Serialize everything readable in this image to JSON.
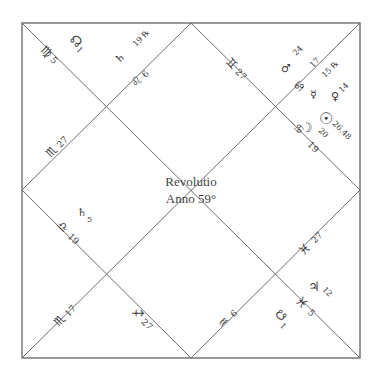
{
  "chart": {
    "title_line1": "Revolutio",
    "title_line2": "Anno 59°",
    "colors": {
      "line": "#6e6e6e",
      "text": "#3a3a3a",
      "background": "#ffffff"
    }
  },
  "labels": [
    {
      "id": "nw-upper-node",
      "glyph": "☊",
      "value": "1",
      "icon": "north-node-icon"
    },
    {
      "id": "nw-virgo-cusp",
      "glyph": "♍",
      "value": "5",
      "icon": "virgo-icon"
    },
    {
      "id": "n-saturn",
      "glyph": "♄",
      "value": "19 ℞",
      "icon": "saturn-icon"
    },
    {
      "id": "n-leo-cusp",
      "glyph": "♌",
      "value": "6",
      "icon": "leo-icon"
    },
    {
      "id": "ne-gemini-cusp",
      "glyph": "♊",
      "value": "27",
      "icon": "gemini-icon"
    },
    {
      "id": "ne-mars",
      "glyph": "♂",
      "value": "24",
      "icon": "mars-icon"
    },
    {
      "id": "ne-cancer-cusp",
      "glyph": "♋",
      "value": "17",
      "icon": "cancer-icon"
    },
    {
      "id": "ne-mercury",
      "glyph": "☿",
      "value": "15 ℞",
      "icon": "mercury-icon"
    },
    {
      "id": "ne-venus",
      "glyph": "♀",
      "value": "14",
      "icon": "venus-icon"
    },
    {
      "id": "ne-sun",
      "glyph": "☉",
      "value": "26.48",
      "icon": "sun-icon"
    },
    {
      "id": "ne-moon",
      "glyph": "☽",
      "value": "20",
      "icon": "moon-icon"
    },
    {
      "id": "ne-cancer-cusp-2",
      "glyph": "♋",
      "value": "19",
      "icon": "cancer-icon"
    },
    {
      "id": "w-scorpio-cusp",
      "glyph": "♏",
      "value": "27",
      "icon": "scorpio-icon"
    },
    {
      "id": "w-saturn-2",
      "glyph": "♄",
      "value": "5",
      "icon": "saturn-icon"
    },
    {
      "id": "w-libra-cusp",
      "glyph": "♎",
      "value": "19",
      "icon": "libra-icon"
    },
    {
      "id": "sw-scorpio-cusp",
      "glyph": "♏",
      "value": "17",
      "icon": "scorpio-icon"
    },
    {
      "id": "s-sagittarius-cusp",
      "glyph": "♐",
      "value": "27",
      "icon": "sagittarius-icon"
    },
    {
      "id": "s-aquarius-cusp",
      "glyph": "♒",
      "value": "6",
      "icon": "aquarius-icon"
    },
    {
      "id": "se-pisces-cusp",
      "glyph": "♓",
      "value": "27",
      "icon": "pisces-icon"
    },
    {
      "id": "se-jupiter",
      "glyph": "♃",
      "value": "12",
      "icon": "jupiter-icon"
    },
    {
      "id": "se-pisces-cusp-2",
      "glyph": "♓",
      "value": "5",
      "icon": "pisces-icon"
    },
    {
      "id": "se-south-node",
      "glyph": "☋",
      "value": "1",
      "icon": "south-node-icon"
    }
  ]
}
